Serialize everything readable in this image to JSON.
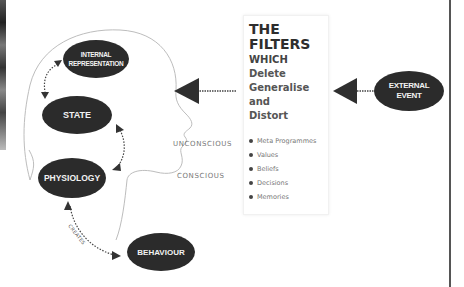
{
  "diagram": {
    "nodes": {
      "internal_representation": {
        "line1": "INTERNAL",
        "line2": "REPRESENTATION"
      },
      "state": {
        "label": "STATE"
      },
      "physiology": {
        "label": "PHYSIOLOGY"
      },
      "behaviour": {
        "label": "BEHAVIOUR"
      },
      "external_event": {
        "line1": "EXTERNAL",
        "line2": "EVENT"
      }
    },
    "edge_labels": {
      "creates": "CREATES"
    },
    "zones": {
      "unconscious": "UNCONSCIOUS",
      "conscious": "CONSCIOUS"
    },
    "filters": {
      "title_line1": "THE",
      "title_line2": "FILTERS",
      "sub_lines": [
        "WHICH",
        "Delete",
        "Generalise",
        "and",
        "Distort"
      ],
      "items": [
        "Meta Programmes",
        "Values",
        "Beliefs",
        "Decisions",
        "Memories"
      ]
    },
    "colors": {
      "node_fill": "#2b2b2b",
      "node_text": "#f2f2f2",
      "outline": "#bdbdbd",
      "arrow": "#333333",
      "muted_text": "#777777"
    }
  }
}
